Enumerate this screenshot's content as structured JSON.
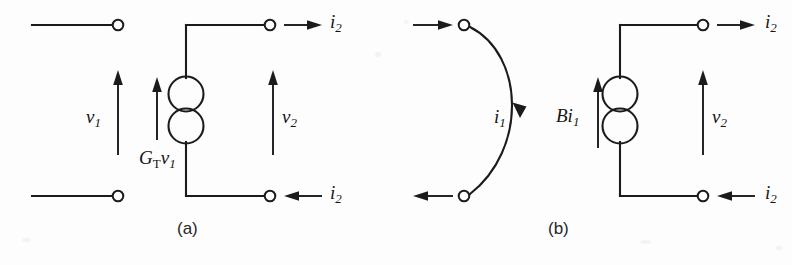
{
  "figure": {
    "background_color": "#fdfdfd",
    "ink_color": "#1b1b1b",
    "panels": [
      {
        "id": "a",
        "caption": "(a)",
        "title_role": "Norton equivalent with voltage-controlled current source",
        "labels": {
          "v1": "v",
          "v1_sub": "1",
          "v2": "v",
          "v2_sub": "2",
          "i2_top": "i",
          "i2_top_sub": "2",
          "i2_bottom": "i",
          "i2_bottom_sub": "2",
          "source": "G",
          "source_sub": "T",
          "source_var": "v",
          "source_var_sub": "1"
        }
      },
      {
        "id": "b",
        "caption": "(b)",
        "title_role": "Current-controlled current source model",
        "labels": {
          "i1": "i",
          "i1_sub": "1",
          "v2": "v",
          "v2_sub": "2",
          "i2_top": "i",
          "i2_top_sub": "2",
          "i2_bottom": "i",
          "i2_bottom_sub": "2",
          "source": "B",
          "source_var": "i",
          "source_var_sub": "1"
        }
      }
    ],
    "elements": {
      "dependent_source_symbol": "two-overlapping-circles-current-source",
      "terminal_symbol": "open-circle-node",
      "arrow_symbol": "solid-triangle-arrowhead"
    }
  }
}
